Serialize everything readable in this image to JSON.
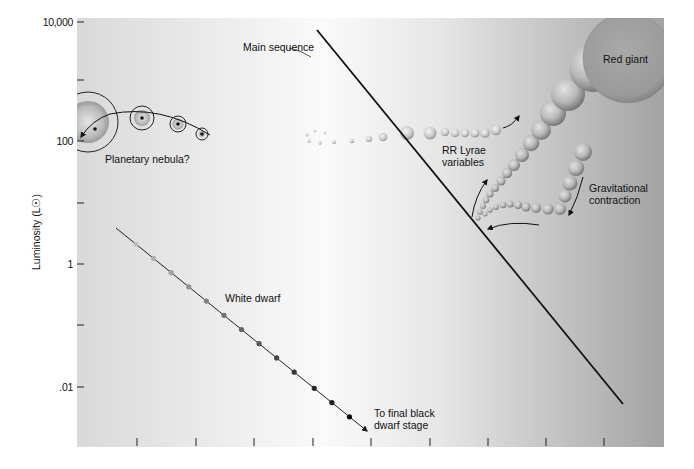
{
  "chart_data": {
    "type": "scatter",
    "title": "",
    "xlabel": "",
    "ylabel": "Luminosity (L☉)",
    "yscale": "log",
    "ylim": [
      0.001,
      10000
    ],
    "y_ticks": [
      {
        "label": "10,000",
        "value": 10000,
        "y": 22
      },
      {
        "label": "",
        "value": 1000,
        "y": 80
      },
      {
        "label": "100",
        "value": 100,
        "y": 141
      },
      {
        "label": "",
        "value": 10,
        "y": 203
      },
      {
        "label": "1",
        "value": 1,
        "y": 264
      },
      {
        "label": "",
        "value": 0.1,
        "y": 325
      },
      {
        "label": ".01",
        "value": 0.01,
        "y": 387
      }
    ],
    "x_ticks_px": [
      137,
      196,
      254,
      313,
      371,
      430,
      488,
      546,
      604
    ],
    "x_tick_labels": [],
    "grid": false,
    "background_gradient": {
      "left": "#d9d9d9",
      "center": "#fafafa",
      "right": "#a3a3a3"
    },
    "annotations": [
      {
        "id": "main-sequence",
        "text": "Main sequence",
        "x": 243,
        "y": 51
      },
      {
        "id": "red-giant",
        "text": "Red giant",
        "x": 603,
        "y": 63
      },
      {
        "id": "planetary-nebula",
        "text": "Planetary nebula?",
        "x": 105,
        "y": 163
      },
      {
        "id": "rr-lyrae-1",
        "text": "RR Lyrae",
        "x": 442,
        "y": 154
      },
      {
        "id": "rr-lyrae-2",
        "text": "variables",
        "x": 442,
        "y": 166
      },
      {
        "id": "gravitational-1",
        "text": "Gravitational",
        "x": 589,
        "y": 192
      },
      {
        "id": "gravitational-2",
        "text": "contraction",
        "x": 589,
        "y": 204
      },
      {
        "id": "white-dwarf",
        "text": "White dwarf",
        "x": 225,
        "y": 302
      },
      {
        "id": "black-dwarf-1",
        "text": "To final black",
        "x": 374,
        "y": 417
      },
      {
        "id": "black-dwarf-2",
        "text": "dwarf stage",
        "x": 374,
        "y": 429
      }
    ],
    "series": [
      {
        "name": "Main sequence",
        "kind": "line",
        "points": [
          [
            317,
            30
          ],
          [
            623,
            404
          ]
        ]
      },
      {
        "name": "White dwarf cooling track",
        "kind": "line-arrow",
        "points": [
          [
            116,
            228
          ],
          [
            367,
            431
          ]
        ],
        "dots": [
          0.08,
          0.15,
          0.22,
          0.29,
          0.36,
          0.43,
          0.5,
          0.57,
          0.64,
          0.71,
          0.79,
          0.86,
          0.93
        ]
      },
      {
        "name": "Planetary nebula",
        "kind": "nebulae",
        "items": [
          {
            "cx": 88,
            "cy": 122,
            "r": 30,
            "rin": 21
          },
          {
            "cx": 142,
            "cy": 118,
            "r": 12,
            "rin": 8
          },
          {
            "cx": 178,
            "cy": 124,
            "r": 8,
            "rin": 5.5
          },
          {
            "cx": 202,
            "cy": 134,
            "r": 6,
            "rin": 0
          }
        ]
      },
      {
        "name": "Horizontal branch",
        "kind": "spheres",
        "items": [
          [
            307,
            135,
            1.4
          ],
          [
            315,
            131,
            1.3
          ],
          [
            325,
            133,
            1.3
          ],
          [
            309,
            141,
            1.7
          ],
          [
            320,
            143,
            1.8
          ],
          [
            334,
            142,
            2
          ],
          [
            352,
            141,
            2.2
          ],
          [
            369,
            139,
            3
          ],
          [
            383,
            137,
            4.3
          ],
          [
            407,
            133,
            7
          ],
          [
            430,
            133,
            6.5
          ],
          [
            445,
            132,
            4.2
          ],
          [
            455,
            133,
            4.3
          ],
          [
            465,
            133,
            4.3
          ],
          [
            475,
            133,
            4.5
          ],
          [
            485,
            133,
            4.8
          ],
          [
            496,
            130,
            5.2
          ]
        ]
      },
      {
        "name": "Giant branch",
        "kind": "spheres",
        "items": [
          [
            478,
            218,
            2.6
          ],
          [
            480,
            212,
            2.8
          ],
          [
            483,
            206,
            3
          ],
          [
            486,
            200,
            3.3
          ],
          [
            490,
            194,
            3.6
          ],
          [
            495,
            188,
            4
          ],
          [
            501,
            181,
            4.5
          ],
          [
            507,
            173,
            5.2
          ],
          [
            514,
            165,
            6
          ],
          [
            522,
            155,
            7
          ],
          [
            531,
            143,
            8.3
          ],
          [
            541,
            130,
            10
          ],
          [
            553,
            113,
            13
          ],
          [
            568,
            94,
            17
          ],
          [
            593,
            68,
            24
          ],
          [
            628,
            58,
            45
          ]
        ]
      },
      {
        "name": "Gravitational contraction track",
        "kind": "spheres",
        "items": [
          [
            583,
            152,
            9
          ],
          [
            576,
            168,
            8.2
          ],
          [
            570,
            183,
            7.5
          ],
          [
            565,
            196,
            6.5
          ],
          [
            560,
            209,
            6
          ],
          [
            548,
            209,
            5.5
          ],
          [
            536,
            208,
            5
          ],
          [
            526,
            207,
            4.5
          ],
          [
            518,
            205,
            4
          ],
          [
            510,
            204,
            3.6
          ],
          [
            503,
            205,
            3.2
          ],
          [
            496,
            207,
            3
          ],
          [
            490,
            210,
            2.7
          ],
          [
            485,
            214,
            2.5
          ]
        ]
      }
    ],
    "arrows": [
      {
        "name": "hb-to-agb-arrow",
        "path": "M 503 128 Q 512 126 519 116"
      },
      {
        "name": "rr-lyrae-up-arrow",
        "path": "M 472 217 Q 475 196 487 180"
      },
      {
        "name": "contraction-down-arrow",
        "path": "M 583 177 Q 578 198 569 215"
      },
      {
        "name": "contraction-left-arrow",
        "path": "M 539 225 Q 510 220 488 229"
      }
    ]
  },
  "axis": {
    "ylabel": "Luminosity (L☉)"
  }
}
